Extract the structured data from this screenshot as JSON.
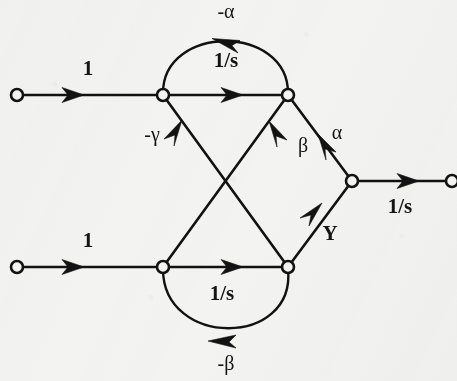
{
  "figure": {
    "background_color": "#f3f3f1",
    "ink_color": "#121212"
  },
  "nodes": [
    {
      "id": "in-top",
      "name": "input-node-top",
      "x": 17,
      "y": 95,
      "kind": "open-circle"
    },
    {
      "id": "n-top-left",
      "name": "node-top-left",
      "x": 163,
      "y": 95,
      "kind": "open-circle"
    },
    {
      "id": "n-top-right",
      "name": "node-top-right",
      "x": 288,
      "y": 95,
      "kind": "open-circle"
    },
    {
      "id": "in-bottom",
      "name": "input-node-bottom",
      "x": 17,
      "y": 267,
      "kind": "open-circle"
    },
    {
      "id": "n-bot-left",
      "name": "node-bottom-left",
      "x": 163,
      "y": 267,
      "kind": "open-circle"
    },
    {
      "id": "n-bot-right",
      "name": "node-bottom-right",
      "x": 288,
      "y": 267,
      "kind": "open-circle"
    },
    {
      "id": "n-right",
      "name": "node-right-junction",
      "x": 352,
      "y": 181,
      "kind": "open-circle"
    },
    {
      "id": "out",
      "name": "output-node",
      "x": 452,
      "y": 181,
      "kind": "open-circle"
    }
  ],
  "edges": [
    {
      "id": "e-in-top",
      "name": "edge-input-top",
      "from": "in-top",
      "to": "n-top-left",
      "label": "1",
      "shape": "straight"
    },
    {
      "id": "e-top-mid",
      "name": "edge-top-forward",
      "from": "n-top-left",
      "to": "n-top-right",
      "label": "1/s",
      "shape": "straight"
    },
    {
      "id": "e-top-arc",
      "name": "edge-top-feedback-arc",
      "from": "n-top-right",
      "to": "n-top-left",
      "label": "-α",
      "shape": "arc-above"
    },
    {
      "id": "e-in-bottom",
      "name": "edge-input-bottom",
      "from": "in-bottom",
      "to": "n-bot-left",
      "label": "1",
      "shape": "straight"
    },
    {
      "id": "e-bottom-mid",
      "name": "edge-bottom-forward",
      "from": "n-bot-left",
      "to": "n-bot-right",
      "label": "1/s",
      "shape": "straight"
    },
    {
      "id": "e-bottom-arc",
      "name": "edge-bottom-feedback-arc",
      "from": "n-bot-right",
      "to": "n-bot-left",
      "label": "-β",
      "shape": "arc-below"
    },
    {
      "id": "e-cross-beta",
      "name": "edge-cross-beta",
      "from": "n-top-right",
      "to": "n-bot-left",
      "label": "β",
      "shape": "diagonal"
    },
    {
      "id": "e-cross-gamma",
      "name": "edge-cross-gamma",
      "from": "n-bot-right",
      "to": "n-top-left",
      "label": "-γ",
      "shape": "diagonal"
    },
    {
      "id": "e-alpha",
      "name": "edge-alpha",
      "from": "n-top-right",
      "to": "n-right",
      "label": "α",
      "shape": "straight"
    },
    {
      "id": "e-y",
      "name": "edge-y",
      "from": "n-bot-right",
      "to": "n-right",
      "label": "Y",
      "shape": "straight"
    },
    {
      "id": "e-output",
      "name": "edge-output",
      "from": "n-right",
      "to": "out",
      "label": "1/s",
      "shape": "straight"
    }
  ],
  "labels": [
    {
      "id": "lbl-in-top",
      "name": "label-input-top-gain",
      "text": "1",
      "x": 88,
      "y": 75,
      "style": "bold"
    },
    {
      "id": "lbl-top-mid",
      "name": "label-top-forward-gain",
      "text": "1/s",
      "x": 226,
      "y": 67,
      "style": "bold"
    },
    {
      "id": "lbl-top-arc",
      "name": "label-top-feedback-gain",
      "text": "-α",
      "x": 226,
      "y": 18,
      "style": "greek"
    },
    {
      "id": "lbl-in-bottom",
      "name": "label-input-bottom-gain",
      "text": "1",
      "x": 88,
      "y": 247,
      "style": "bold"
    },
    {
      "id": "lbl-bottom-mid",
      "name": "label-bottom-forward-gain",
      "text": "1/s",
      "x": 222,
      "y": 300,
      "style": "bold"
    },
    {
      "id": "lbl-bottom-arc",
      "name": "label-bottom-feedback-gain",
      "text": "-β",
      "x": 226,
      "y": 370,
      "style": "greek"
    },
    {
      "id": "lbl-gamma",
      "name": "label-gamma-gain",
      "text": "-γ",
      "x": 152,
      "y": 141,
      "style": "greek"
    },
    {
      "id": "lbl-beta",
      "name": "label-beta-gain",
      "text": "β",
      "x": 303,
      "y": 152,
      "style": "greek"
    },
    {
      "id": "lbl-alpha",
      "name": "label-alpha-gain",
      "text": "α",
      "x": 337,
      "y": 139,
      "style": "greek"
    },
    {
      "id": "lbl-y",
      "name": "label-y-signal",
      "text": "Y",
      "x": 330,
      "y": 240,
      "style": "bold"
    },
    {
      "id": "lbl-output",
      "name": "label-output-gain",
      "text": "1/s",
      "x": 400,
      "y": 213,
      "style": "bold"
    }
  ]
}
